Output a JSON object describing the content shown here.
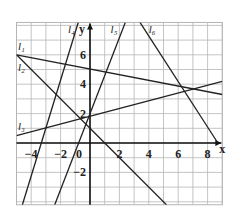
{
  "chart_data": {
    "type": "line",
    "title": "",
    "xlabel": "x",
    "ylabel": "y",
    "xlim": [
      -5,
      9
    ],
    "ylim": [
      -4.2,
      8.2
    ],
    "grid": true,
    "x_ticks": [
      -4,
      -2,
      0,
      2,
      4,
      6,
      8
    ],
    "y_ticks": [
      -2,
      2,
      4,
      6
    ],
    "x_tick_labels": [
      "-4",
      "-2",
      "0",
      "2",
      "4",
      "6",
      "8"
    ],
    "y_tick_labels": [
      "-2",
      "2",
      "4",
      "6"
    ],
    "series": [
      {
        "name": "l1",
        "label": "l₁",
        "points": [
          [
            -5,
            6
          ],
          [
            9,
            3.3
          ]
        ]
      },
      {
        "name": "l2",
        "label": "l₂",
        "points": [
          [
            -5,
            6
          ],
          [
            5.2,
            -4.2
          ]
        ]
      },
      {
        "name": "l3",
        "label": "l₃",
        "points": [
          [
            -5,
            0.5
          ],
          [
            9,
            4.2
          ]
        ]
      },
      {
        "name": "l4",
        "label": "l₄",
        "points": [
          [
            -4.6,
            -4.2
          ],
          [
            -0.8,
            8.2
          ]
        ]
      },
      {
        "name": "l5",
        "label": "l₅",
        "points": [
          [
            -2.4,
            -4.2
          ],
          [
            2.4,
            8.2
          ]
        ]
      },
      {
        "name": "l6",
        "label": "l₆",
        "points": [
          [
            3.4,
            8.2
          ],
          [
            8.7,
            0
          ]
        ]
      }
    ],
    "line_labels": [
      {
        "text": "l₁",
        "x": -4.9,
        "y": 6.3
      },
      {
        "text": "l₂",
        "x": -4.9,
        "y": 4.9
      },
      {
        "text": "l₃",
        "x": -4.9,
        "y": 0.9
      },
      {
        "text": "l₄",
        "x": -1.5,
        "y": 7.5
      },
      {
        "text": "l₅",
        "x": 1.4,
        "y": 7.5
      },
      {
        "text": "l₆",
        "x": 4.0,
        "y": 7.5
      }
    ],
    "colors": {
      "line": "#222222",
      "grid": "#b5b5b5",
      "axis": "#111111"
    }
  }
}
